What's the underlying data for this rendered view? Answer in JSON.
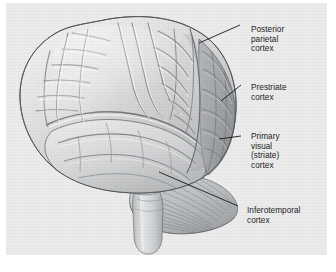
{
  "figure": {
    "background_color": "#ffffff",
    "panel_color": "#ececed",
    "label_color": "#1c1c1c",
    "leader_line_color": "#16181a",
    "brain_light_color": "#dcdcdc",
    "brain_shaded_color": "#a9abad",
    "cerebellum_color": "#b9bcbe",
    "brainstem_color": "#c9cbcc"
  },
  "labels": [
    {
      "id": "posterior-parietal-cortex",
      "lines": [
        "Posterior",
        "parietal",
        "cortex"
      ],
      "line1": "Posterior",
      "line2": "parietal",
      "line3": "cortex",
      "x": 245,
      "y": 22,
      "leader": {
        "x1": 199,
        "y1": 43,
        "x2": 240,
        "y2": 25
      }
    },
    {
      "id": "prestriate-cortex",
      "lines": [
        "Prestriate",
        "cortex"
      ],
      "line1": "Prestriate",
      "line2": "cortex",
      "x": 245,
      "y": 80,
      "leader": {
        "x1": 221,
        "y1": 101,
        "x2": 241,
        "y2": 85
      }
    },
    {
      "id": "primary-visual-striate-cortex",
      "lines": [
        "Primary",
        "visual",
        "(striate)",
        "cortex"
      ],
      "line1": "Primary",
      "line2": "visual",
      "line3": "(striate)",
      "line4": "cortex",
      "x": 245,
      "y": 129,
      "leader": {
        "x1": 219,
        "y1": 139,
        "x2": 241,
        "y2": 136
      }
    },
    {
      "id": "inferotemporal-cortex",
      "lines": [
        "Inferotemporal",
        "cortex"
      ],
      "line1": "Inferotemporal",
      "line2": "cortex",
      "x": 241,
      "y": 203,
      "leader": {
        "x1": 159,
        "y1": 172,
        "x2": 238,
        "y2": 206
      }
    }
  ]
}
